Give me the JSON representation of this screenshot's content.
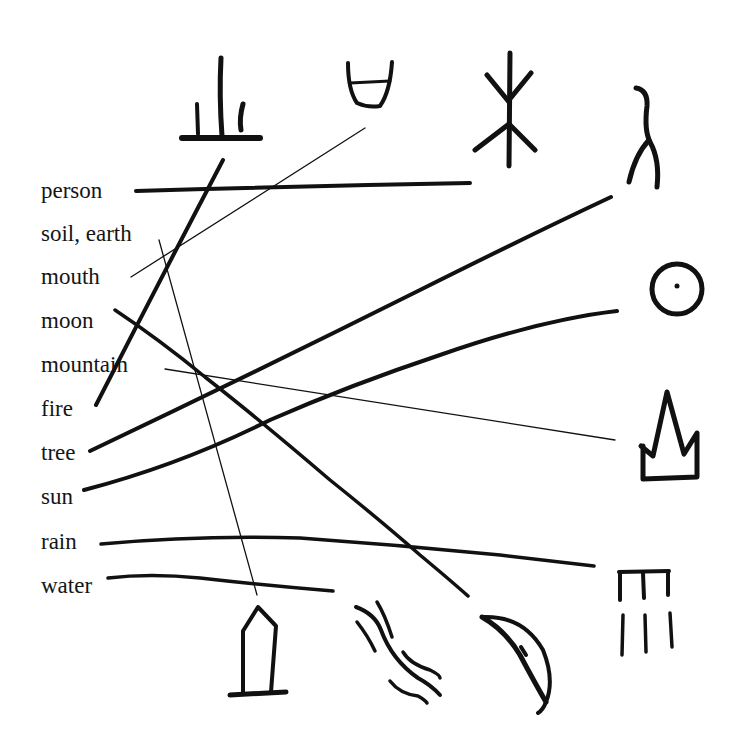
{
  "words": [
    {
      "id": "person",
      "label": "person"
    },
    {
      "id": "soil",
      "label": "soil, earth"
    },
    {
      "id": "mouth",
      "label": "mouth"
    },
    {
      "id": "moon",
      "label": "moon"
    },
    {
      "id": "mountain",
      "label": "mountain"
    },
    {
      "id": "fire",
      "label": "fire"
    },
    {
      "id": "tree",
      "label": "tree"
    },
    {
      "id": "sun",
      "label": "sun"
    },
    {
      "id": "rain",
      "label": "rain"
    },
    {
      "id": "water",
      "label": "water"
    }
  ],
  "pictographs": [
    {
      "id": "fire-glyph",
      "meaning": "fire",
      "icon": "fire-pictograph"
    },
    {
      "id": "mouth-glyph",
      "meaning": "mouth",
      "icon": "mouth-pictograph"
    },
    {
      "id": "tree-glyph",
      "meaning": "tree",
      "icon": "tree-pictograph"
    },
    {
      "id": "person-glyph",
      "meaning": "person",
      "icon": "person-pictograph"
    },
    {
      "id": "sun-glyph",
      "meaning": "sun",
      "icon": "sun-pictograph"
    },
    {
      "id": "mountain-glyph",
      "meaning": "mountain",
      "icon": "mountain-pictograph"
    },
    {
      "id": "rain-glyph",
      "meaning": "rain",
      "icon": "rain-pictograph"
    },
    {
      "id": "soil-glyph",
      "meaning": "soil, earth",
      "icon": "soil-pictograph"
    },
    {
      "id": "water-glyph",
      "meaning": "water",
      "icon": "water-pictograph"
    },
    {
      "id": "moon-glyph",
      "meaning": "moon",
      "icon": "moon-pictograph"
    }
  ],
  "connections": [
    {
      "from": "person",
      "to": "tree-glyph",
      "style": "thick"
    },
    {
      "from": "soil",
      "to": "soil-glyph",
      "style": "thin"
    },
    {
      "from": "mouth",
      "to": "mouth-glyph",
      "style": "thin"
    },
    {
      "from": "moon",
      "to": "moon-glyph",
      "style": "thick"
    },
    {
      "from": "mountain",
      "to": "mountain-glyph",
      "style": "thin"
    },
    {
      "from": "fire",
      "to": "fire-glyph",
      "style": "thick"
    },
    {
      "from": "tree",
      "to": "person-glyph",
      "style": "thick"
    },
    {
      "from": "sun",
      "to": "sun-glyph",
      "style": "thick"
    },
    {
      "from": "rain",
      "to": "rain-glyph",
      "style": "thick"
    },
    {
      "from": "water",
      "to": "water-glyph",
      "style": "thick"
    }
  ]
}
